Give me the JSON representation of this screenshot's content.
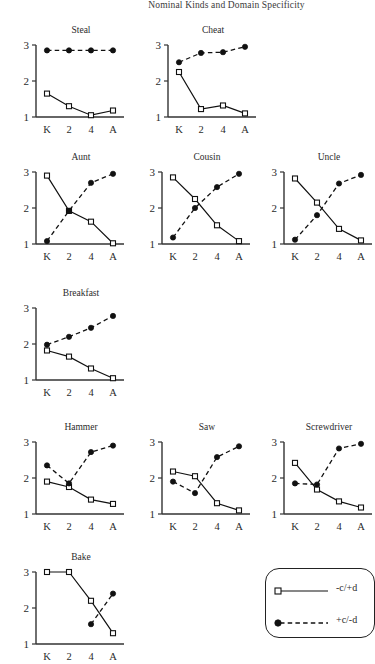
{
  "header": {
    "running_head": "Nominal Kinds and Domain Specificity"
  },
  "legend": {
    "entries": [
      {
        "label": "-c/+d",
        "style": "solid",
        "marker": "square"
      },
      {
        "label": "+c/-d",
        "style": "dashed",
        "marker": "circle"
      }
    ]
  },
  "axis": {
    "x_ticks": [
      "K",
      "2",
      "4",
      "A"
    ],
    "y_ticks": [
      "3",
      "2",
      "1"
    ],
    "ylim": [
      1,
      3
    ]
  },
  "chart_data": [
    {
      "type": "line",
      "title": "Steal",
      "categories": [
        "K",
        "2",
        "4",
        "A"
      ],
      "xlabel": "",
      "ylabel": "",
      "ylim": [
        1,
        3
      ],
      "grid": false,
      "series": [
        {
          "name": "-c/+d",
          "values": [
            1.65,
            1.3,
            1.05,
            1.18
          ]
        },
        {
          "name": "+c/-d",
          "values": [
            2.85,
            2.85,
            2.85,
            2.85
          ]
        }
      ]
    },
    {
      "type": "line",
      "title": "Cheat",
      "categories": [
        "K",
        "2",
        "4",
        "A"
      ],
      "xlabel": "",
      "ylabel": "",
      "ylim": [
        1,
        3
      ],
      "grid": false,
      "series": [
        {
          "name": "-c/+d",
          "values": [
            2.25,
            1.22,
            1.32,
            1.1
          ]
        },
        {
          "name": "+c/-d",
          "values": [
            2.52,
            2.78,
            2.8,
            2.95
          ]
        }
      ]
    },
    {
      "type": "line",
      "title": "Aunt",
      "categories": [
        "K",
        "2",
        "4",
        "A"
      ],
      "xlabel": "",
      "ylabel": "",
      "ylim": [
        1,
        3
      ],
      "grid": false,
      "series": [
        {
          "name": "-c/+d",
          "values": [
            2.9,
            1.92,
            1.62,
            1.02
          ]
        },
        {
          "name": "+c/-d",
          "values": [
            1.08,
            1.92,
            2.7,
            2.95
          ]
        }
      ]
    },
    {
      "type": "line",
      "title": "Cousin",
      "categories": [
        "K",
        "2",
        "4",
        "A"
      ],
      "xlabel": "",
      "ylabel": "",
      "ylim": [
        1,
        3
      ],
      "grid": false,
      "series": [
        {
          "name": "-c/+d",
          "values": [
            2.85,
            2.25,
            1.52,
            1.08
          ]
        },
        {
          "name": "+c/-d",
          "values": [
            1.18,
            2.0,
            2.58,
            2.95
          ]
        }
      ]
    },
    {
      "type": "line",
      "title": "Uncle",
      "categories": [
        "K",
        "2",
        "4",
        "A"
      ],
      "xlabel": "",
      "ylabel": "",
      "ylim": [
        1,
        3
      ],
      "grid": false,
      "series": [
        {
          "name": "-c/+d",
          "values": [
            2.82,
            2.15,
            1.42,
            1.1
          ]
        },
        {
          "name": "+c/-d",
          "values": [
            1.12,
            1.8,
            2.68,
            2.92
          ]
        }
      ]
    },
    {
      "type": "line",
      "title": "Breakfast",
      "categories": [
        "K",
        "2",
        "4",
        "A"
      ],
      "xlabel": "",
      "ylabel": "",
      "ylim": [
        1,
        3
      ],
      "grid": false,
      "series": [
        {
          "name": "-c/+d",
          "values": [
            1.82,
            1.65,
            1.32,
            1.05
          ]
        },
        {
          "name": "+c/-d",
          "values": [
            1.98,
            2.2,
            2.45,
            2.78
          ]
        }
      ]
    },
    {
      "type": "line",
      "title": "Hammer",
      "categories": [
        "K",
        "2",
        "4",
        "A"
      ],
      "xlabel": "",
      "ylabel": "",
      "ylim": [
        1,
        3
      ],
      "grid": false,
      "series": [
        {
          "name": "-c/+d",
          "values": [
            1.9,
            1.75,
            1.4,
            1.28
          ]
        },
        {
          "name": "+c/-d",
          "values": [
            2.35,
            1.85,
            2.72,
            2.9
          ]
        }
      ]
    },
    {
      "type": "line",
      "title": "Saw",
      "categories": [
        "K",
        "2",
        "4",
        "A"
      ],
      "xlabel": "",
      "ylabel": "",
      "ylim": [
        1,
        3
      ],
      "grid": false,
      "series": [
        {
          "name": "-c/+d",
          "values": [
            2.18,
            2.05,
            1.3,
            1.1
          ]
        },
        {
          "name": "+c/-d",
          "values": [
            1.9,
            1.58,
            2.58,
            2.88
          ]
        }
      ]
    },
    {
      "type": "line",
      "title": "Screwdriver",
      "categories": [
        "K",
        "2",
        "4",
        "A"
      ],
      "xlabel": "",
      "ylabel": "",
      "ylim": [
        1,
        3
      ],
      "grid": false,
      "series": [
        {
          "name": "-c/+d",
          "values": [
            2.42,
            1.68,
            1.35,
            1.18
          ]
        },
        {
          "name": "+c/-d",
          "values": [
            1.85,
            1.82,
            2.82,
            2.95
          ]
        }
      ]
    },
    {
      "type": "line",
      "title": "Bake",
      "categories": [
        "K",
        "2",
        "4",
        "A"
      ],
      "xlabel": "",
      "ylabel": "",
      "ylim": [
        1,
        3
      ],
      "grid": false,
      "clipped": true,
      "series": [
        {
          "name": "-c/+d",
          "values": [
            3.0,
            3.0,
            2.2,
            1.3
          ]
        },
        {
          "name": "+c/-d",
          "values": [
            null,
            null,
            1.55,
            2.4
          ]
        }
      ]
    }
  ]
}
